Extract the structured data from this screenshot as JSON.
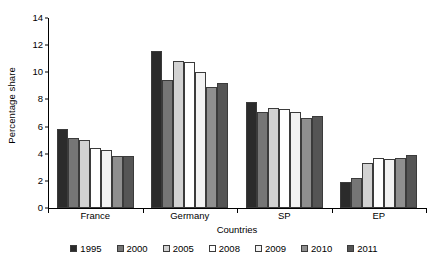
{
  "chart_data": {
    "type": "bar",
    "title": "",
    "xlabel": "Countries",
    "ylabel": "Percentage share",
    "categories": [
      "France",
      "Germany",
      "SP",
      "EP"
    ],
    "yticks": [
      0,
      2,
      4,
      6,
      8,
      10,
      12,
      14
    ],
    "ylim": [
      0,
      14
    ],
    "grid": false,
    "legend_position": "bottom",
    "series": [
      {
        "name": "1995",
        "color": "#2b2b2b",
        "values": [
          5.8,
          11.55,
          7.8,
          1.9
        ]
      },
      {
        "name": "2000",
        "color": "#767676",
        "values": [
          5.15,
          9.45,
          7.05,
          2.2
        ]
      },
      {
        "name": "2005",
        "color": "#d2d2d2",
        "values": [
          5.0,
          10.85,
          7.4,
          3.35
        ]
      },
      {
        "name": "2008",
        "color": "#ffffff",
        "values": [
          4.4,
          10.75,
          7.3,
          3.7
        ]
      },
      {
        "name": "2009",
        "color": "#f2f2f2",
        "values": [
          4.25,
          10.05,
          7.05,
          3.6
        ]
      },
      {
        "name": "2010",
        "color": "#8f8f8f",
        "values": [
          3.85,
          8.9,
          6.6,
          3.65
        ]
      },
      {
        "name": "2011",
        "color": "#555555",
        "values": [
          3.8,
          9.2,
          6.75,
          3.9
        ]
      }
    ]
  }
}
